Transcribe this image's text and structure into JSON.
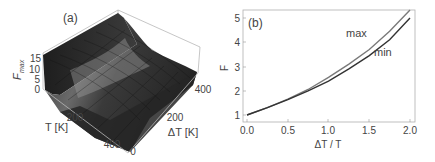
{
  "chart_data": [
    {
      "panel": "(a)",
      "type": "surface3d",
      "title": "",
      "zlabel": "F_max",
      "zlabel_main": "F",
      "zlabel_sub": "max",
      "xlabel": "T [K]",
      "ylabel": "ΔT [K]",
      "x_ticks": [
        "200",
        "400"
      ],
      "y_ticks": [
        "0",
        "200",
        "400"
      ],
      "z_ticks": [
        "0",
        "5",
        "10",
        "15"
      ],
      "xlim": [
        0,
        400
      ],
      "ylim": [
        0,
        400
      ],
      "zlim": [
        0,
        17
      ],
      "description": "F_max grows steeply as T approaches 0 for large ΔT; surface is near 1 over most of the domain",
      "colors": {
        "surface_dark": "#2a2a2a",
        "surface_light": "#8a8a8a",
        "box": "#b0b0b0"
      }
    },
    {
      "panel": "(b)",
      "type": "line",
      "title": "",
      "xlabel": "ΔT / T",
      "ylabel": "F",
      "xlim": [
        0,
        2
      ],
      "ylim": [
        0.75,
        5.3
      ],
      "x_ticks": [
        "0.0",
        "0.5",
        "1.0",
        "1.5",
        "2.0"
      ],
      "y_ticks": [
        "1",
        "2",
        "3",
        "4",
        "5"
      ],
      "x": [
        0.0,
        0.25,
        0.5,
        0.75,
        1.0,
        1.25,
        1.5,
        1.75,
        2.0
      ],
      "series": [
        {
          "name": "max",
          "color": "#7a7a7a",
          "values": [
            1.0,
            1.3,
            1.65,
            2.05,
            2.55,
            3.1,
            3.7,
            4.45,
            5.35
          ]
        },
        {
          "name": "min",
          "color": "#333333",
          "values": [
            1.0,
            1.3,
            1.63,
            2.0,
            2.4,
            2.9,
            3.45,
            4.1,
            5.0
          ]
        }
      ],
      "annotations": [
        "max",
        "min"
      ],
      "grid": false,
      "legend": "inline labels"
    }
  ],
  "panels": {
    "a": {
      "label": "(a)"
    },
    "b": {
      "label": "(b)",
      "label_max": "max",
      "label_min": "min"
    }
  }
}
